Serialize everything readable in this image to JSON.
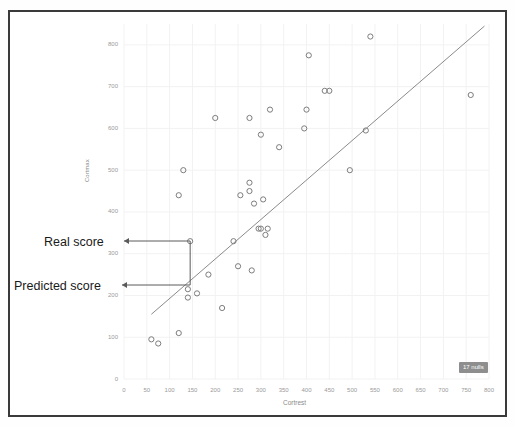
{
  "chart_data": {
    "type": "scatter",
    "title": "",
    "xlabel": "Cortrest",
    "ylabel": "Cortmax",
    "xlim": [
      0,
      800
    ],
    "ylim": [
      0,
      850
    ],
    "xticks": [
      0,
      50,
      100,
      150,
      200,
      250,
      300,
      350,
      400,
      450,
      500,
      550,
      600,
      650,
      700,
      750,
      800
    ],
    "yticks": [
      0,
      100,
      200,
      300,
      400,
      500,
      600,
      700,
      800
    ],
    "grid": true,
    "legend": "none",
    "marker": "open-circle",
    "point_color": "#7d7d7d",
    "line_color": "#8a8a8a",
    "points": [
      {
        "x": 60,
        "y": 95
      },
      {
        "x": 75,
        "y": 85
      },
      {
        "x": 120,
        "y": 110
      },
      {
        "x": 120,
        "y": 440
      },
      {
        "x": 130,
        "y": 500
      },
      {
        "x": 140,
        "y": 215
      },
      {
        "x": 140,
        "y": 195
      },
      {
        "x": 145,
        "y": 330
      },
      {
        "x": 160,
        "y": 205
      },
      {
        "x": 185,
        "y": 250
      },
      {
        "x": 200,
        "y": 625
      },
      {
        "x": 215,
        "y": 170
      },
      {
        "x": 240,
        "y": 330
      },
      {
        "x": 250,
        "y": 270
      },
      {
        "x": 255,
        "y": 440
      },
      {
        "x": 275,
        "y": 470
      },
      {
        "x": 275,
        "y": 450
      },
      {
        "x": 275,
        "y": 625
      },
      {
        "x": 280,
        "y": 260
      },
      {
        "x": 285,
        "y": 420
      },
      {
        "x": 295,
        "y": 360
      },
      {
        "x": 300,
        "y": 585
      },
      {
        "x": 300,
        "y": 360
      },
      {
        "x": 305,
        "y": 430
      },
      {
        "x": 310,
        "y": 345
      },
      {
        "x": 315,
        "y": 360
      },
      {
        "x": 320,
        "y": 645
      },
      {
        "x": 340,
        "y": 555
      },
      {
        "x": 395,
        "y": 600
      },
      {
        "x": 400,
        "y": 645
      },
      {
        "x": 405,
        "y": 775
      },
      {
        "x": 440,
        "y": 690
      },
      {
        "x": 450,
        "y": 690
      },
      {
        "x": 495,
        "y": 500
      },
      {
        "x": 530,
        "y": 595
      },
      {
        "x": 540,
        "y": 820
      },
      {
        "x": 760,
        "y": 680
      }
    ],
    "fit_line": {
      "label": "regression",
      "x1": 60,
      "y1": 155,
      "x2": 790,
      "y2": 845
    },
    "annotations": [
      {
        "name": "real-score",
        "label": "Real score",
        "target_x": 145,
        "target_y": 330
      },
      {
        "name": "predicted-score",
        "label": "Predicted score",
        "target_x": 145,
        "target_y": 240
      }
    ]
  },
  "axes": {
    "y_title": "Cortmax",
    "x_title": "Cortrest"
  },
  "badge": {
    "nulls_label": "17 nulls"
  },
  "topbar": {
    "stub_text": ""
  }
}
